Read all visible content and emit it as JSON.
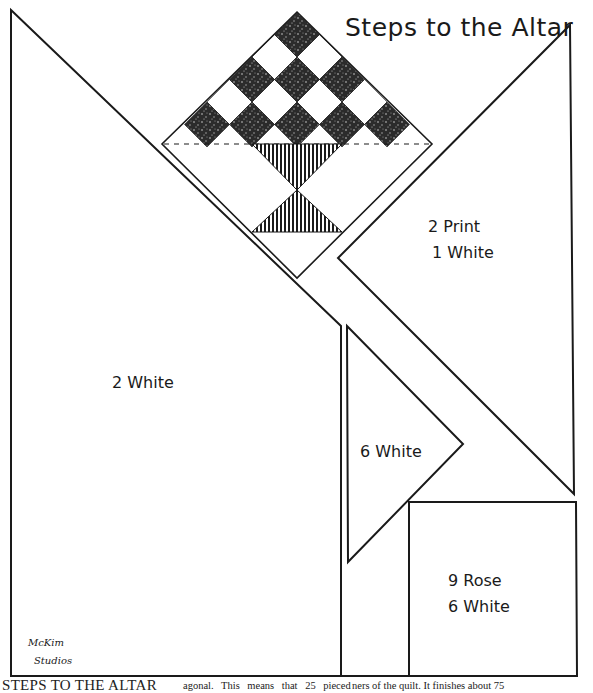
{
  "title": "Steps to the Altar",
  "pieces": [
    {
      "id": "large-left-triangle",
      "label": "2 White"
    },
    {
      "id": "right-triangle",
      "label_line1": "2 Print",
      "label_line2": "1 White"
    },
    {
      "id": "small-triangle",
      "label": "6 White"
    },
    {
      "id": "square",
      "label_line1": "9 Rose",
      "label_line2": "6 White"
    }
  ],
  "studio": {
    "line1": "McKim",
    "line2": "Studios"
  },
  "caption": {
    "heading": "STEPS TO THE ALTAR",
    "col1_line1": "agonal.  This means that 25 pieced",
    "col1_line2": "blocks and alternating plain blocks",
    "col2_line1": "ners of the quilt. It finishes about 75",
    "col2_line2": "by 90 inches and takes of white and"
  },
  "colors": {
    "ink": "#1a1a1a",
    "paper": "#ffffff",
    "print_fill": "#2b2b2b"
  }
}
